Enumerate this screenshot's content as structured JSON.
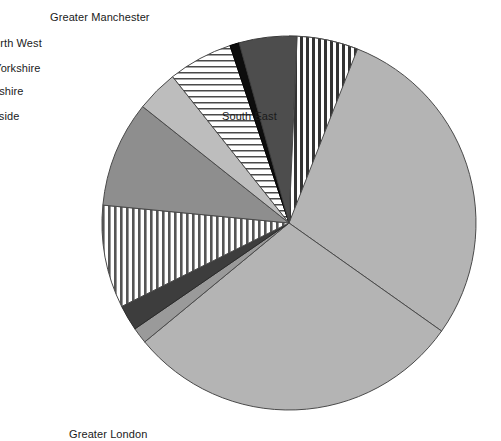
{
  "chart_data": {
    "type": "pie",
    "title": "",
    "subtitle": "",
    "xlabel": "",
    "ylabel": "",
    "grid": false,
    "legend_position": "none",
    "label_style": "external-text-labels",
    "start_angle_deg": 0,
    "direction": "clockwise",
    "center": {
      "cx": 289,
      "cy": 223,
      "r": 187
    },
    "categories": [
      "Greater Manchester",
      "South East",
      "Greater London",
      "East Anglia",
      "South West",
      "West Midlands",
      "West Midlands MC",
      "East Midlands",
      "Yorkshire & Humberside",
      "South Yorkshire",
      "West Yorkshire",
      "North West"
    ],
    "values": [
      5.0,
      29.8,
      29.2,
      1.4,
      2.2,
      8.9,
      9.2,
      3.6,
      5.6,
      0.8,
      5.0,
      5.3
    ],
    "slices": [
      {
        "label": "Greater Manchester",
        "value": 5.0,
        "start_deg": 0.0,
        "end_deg": 18.0,
        "fill": "#ffffff",
        "pattern": "none",
        "stroke": "#4a4a4a"
      },
      {
        "label": "South East",
        "value": 29.8,
        "start_deg": 18.0,
        "end_deg": 125.3,
        "fill": "#b4b4b4",
        "pattern": "none",
        "stroke": "#4a4a4a"
      },
      {
        "label": "Greater London",
        "value": 29.2,
        "start_deg": 125.3,
        "end_deg": 230.5,
        "fill": "#b4b4b4",
        "pattern": "none",
        "stroke": "#4a4a4a"
      },
      {
        "label": "East Anglia",
        "value": 1.4,
        "start_deg": 230.5,
        "end_deg": 235.5,
        "fill": "#9a9a9a",
        "pattern": "none",
        "stroke": "#4a4a4a"
      },
      {
        "label": "South West",
        "value": 2.2,
        "start_deg": 235.5,
        "end_deg": 243.5,
        "fill": "#3d3d3d",
        "pattern": "none",
        "stroke": "#2a2a2a"
      },
      {
        "label": "West Midlands",
        "value": 8.9,
        "start_deg": 243.5,
        "end_deg": 275.5,
        "fill": "#ffffff",
        "pattern": "vertical-stripes",
        "stroke": "#4a4a4a"
      },
      {
        "label": "West Midlands MC",
        "value": 9.2,
        "start_deg": 275.5,
        "end_deg": 308.5,
        "fill": "#8e8e8e",
        "pattern": "none",
        "stroke": "#4a4a4a"
      },
      {
        "label": "East Midlands",
        "value": 3.6,
        "start_deg": 308.5,
        "end_deg": 321.5,
        "fill": "#bdbdbd",
        "pattern": "none",
        "stroke": "#4a4a4a"
      },
      {
        "label": "Yorkshire & Humberside",
        "value": 5.6,
        "start_deg": 321.5,
        "end_deg": 341.6,
        "fill": "#ffffff",
        "pattern": "horizontal-stripes",
        "stroke": "#4a4a4a"
      },
      {
        "label": "South Yorkshire",
        "value": 0.8,
        "start_deg": 341.6,
        "end_deg": 344.5,
        "fill": "#0d0d0d",
        "pattern": "none",
        "stroke": "#000000"
      },
      {
        "label": "West Yorkshire",
        "value": 5.0,
        "start_deg": 344.5,
        "end_deg": 362.5,
        "fill": "#4d4d4d",
        "pattern": "none",
        "stroke": "#3a3a3a"
      },
      {
        "label": "North West",
        "value": 5.3,
        "start_deg": 362.5,
        "end_deg": 381.5,
        "fill": "#ffffff",
        "pattern": "vertical-stripes-dark",
        "stroke": "#4a4a4a"
      }
    ],
    "annotations": [
      {
        "text": "Greater Manchester",
        "x": 300,
        "y": 11,
        "align": "center"
      },
      {
        "text": "North West",
        "x": 236,
        "y": 37,
        "align": "center"
      },
      {
        "text": "West Yorkshire",
        "x": 216,
        "y": 62,
        "align": "center"
      },
      {
        "text": "South Yorkshire",
        "x": 195,
        "y": 85,
        "align": "center"
      },
      {
        "text": "Yorkshire & Humberside",
        "x": 149,
        "y": 110,
        "align": "center"
      },
      {
        "text": "East Midlands",
        "x": 108,
        "y": 148,
        "align": "center"
      },
      {
        "text": "West Midlands MC",
        "x": 96,
        "y": 219,
        "align": "center"
      },
      {
        "text": "West Midlands",
        "x": 104,
        "y": 310,
        "align": "center"
      },
      {
        "text": "South West",
        "x": 126,
        "y": 362,
        "align": "center"
      },
      {
        "text": "East Anglia",
        "x": 138,
        "y": 382,
        "align": "center"
      },
      {
        "text": "Greater London",
        "x": 319,
        "y": 428,
        "align": "center"
      },
      {
        "text": "South East",
        "x": 472,
        "y": 110,
        "align": "center"
      }
    ]
  },
  "colors": {
    "background": "#ffffff",
    "text": "#1a1a1a",
    "outline": "#4a4a4a",
    "light_gray": "#b4b4b4",
    "medium_gray": "#8e8e8e",
    "dark_gray": "#4d4d4d",
    "black": "#0d0d0d"
  }
}
